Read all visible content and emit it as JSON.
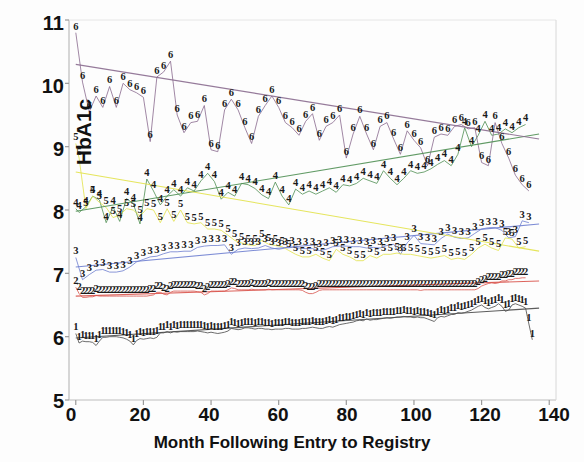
{
  "chart_data": {
    "type": "line",
    "title": "",
    "xlabel": "Month Following Entry to Registry",
    "ylabel": "HbA1c",
    "xlim": [
      -2,
      142
    ],
    "ylim": [
      5,
      11
    ],
    "xticks": [
      0,
      20,
      40,
      60,
      80,
      100,
      120,
      140
    ],
    "yticks": [
      5,
      6,
      7,
      8,
      9,
      10,
      11
    ],
    "grid": false,
    "legend": "none",
    "marker_style": "series index digit plotted at each data point",
    "series": [
      {
        "name": "1",
        "label": "1",
        "color": "#4a4a4a",
        "trend": {
          "x0": 0,
          "y0": 5.98,
          "x1": 137,
          "y1": 6.45
        },
        "x": [
          0,
          1,
          2,
          3,
          4,
          5,
          6,
          7,
          8,
          9,
          10,
          11,
          12,
          13,
          14,
          15,
          16,
          17,
          18,
          19,
          20,
          21,
          22,
          23,
          24,
          25,
          26,
          27,
          28,
          29,
          30,
          31,
          32,
          33,
          34,
          35,
          36,
          37,
          38,
          39,
          40,
          41,
          42,
          43,
          44,
          45,
          46,
          47,
          48,
          49,
          50,
          51,
          52,
          53,
          54,
          55,
          56,
          57,
          58,
          59,
          60,
          61,
          62,
          63,
          64,
          65,
          66,
          67,
          68,
          69,
          70,
          71,
          72,
          73,
          74,
          75,
          76,
          77,
          78,
          79,
          80,
          81,
          82,
          83,
          84,
          85,
          86,
          87,
          88,
          89,
          90,
          91,
          92,
          93,
          94,
          95,
          96,
          97,
          98,
          99,
          100,
          101,
          102,
          103,
          104,
          105,
          106,
          107,
          108,
          109,
          110,
          111,
          112,
          113,
          114,
          115,
          116,
          117,
          118,
          119,
          120,
          121,
          122,
          123,
          124,
          125,
          126,
          127,
          128,
          129,
          130,
          131,
          132,
          133,
          134,
          135
        ],
        "y": [
          6.05,
          5.9,
          5.93,
          5.92,
          5.92,
          5.91,
          5.86,
          5.93,
          5.99,
          5.99,
          6.0,
          6.0,
          6.0,
          5.99,
          5.98,
          5.96,
          5.93,
          5.87,
          5.94,
          5.97,
          5.96,
          5.97,
          5.98,
          5.97,
          5.99,
          6.06,
          6.06,
          6.08,
          6.06,
          6.08,
          6.07,
          6.08,
          6.08,
          6.08,
          6.08,
          6.08,
          6.09,
          6.08,
          6.07,
          6.06,
          6.07,
          6.06,
          6.05,
          6.06,
          6.07,
          6.09,
          6.13,
          6.12,
          6.11,
          6.12,
          6.14,
          6.14,
          6.13,
          6.12,
          6.13,
          6.13,
          6.12,
          6.12,
          6.11,
          6.12,
          6.12,
          6.12,
          6.13,
          6.13,
          6.12,
          6.12,
          6.12,
          6.13,
          6.13,
          6.14,
          6.15,
          6.14,
          6.13,
          6.13,
          6.15,
          6.16,
          6.15,
          6.17,
          6.19,
          6.2,
          6.21,
          6.22,
          6.23,
          6.25,
          6.26,
          6.25,
          6.28,
          6.26,
          6.27,
          6.27,
          6.28,
          6.29,
          6.3,
          6.29,
          6.3,
          6.31,
          6.31,
          6.32,
          6.31,
          6.31,
          6.3,
          6.31,
          6.3,
          6.3,
          6.28,
          6.26,
          6.24,
          6.3,
          6.32,
          6.31,
          6.33,
          6.35,
          6.35,
          6.38,
          6.37,
          6.38,
          6.4,
          6.42,
          6.45,
          6.48,
          6.5,
          6.46,
          6.44,
          6.46,
          6.48,
          6.52,
          6.48,
          6.4,
          6.42,
          6.5,
          6.52,
          6.5,
          6.48,
          6.45,
          6.2,
          5.95
        ]
      },
      {
        "name": "2",
        "label": "2",
        "color": "#d9544d",
        "trend": {
          "x0": 0,
          "y0": 6.64,
          "x1": 137,
          "y1": 6.88
        },
        "x": [
          0,
          1,
          2,
          3,
          4,
          5,
          6,
          7,
          8,
          9,
          10,
          11,
          12,
          13,
          14,
          15,
          16,
          17,
          18,
          19,
          20,
          21,
          22,
          23,
          24,
          25,
          26,
          27,
          28,
          29,
          30,
          31,
          32,
          33,
          34,
          35,
          36,
          37,
          38,
          39,
          40,
          41,
          42,
          43,
          44,
          45,
          46,
          47,
          48,
          49,
          50,
          51,
          52,
          53,
          54,
          55,
          56,
          57,
          58,
          59,
          60,
          61,
          62,
          63,
          64,
          65,
          66,
          67,
          68,
          69,
          70,
          71,
          72,
          73,
          74,
          75,
          76,
          77,
          78,
          79,
          80,
          81,
          82,
          83,
          84,
          85,
          86,
          87,
          88,
          89,
          90,
          91,
          92,
          93,
          94,
          95,
          96,
          97,
          98,
          99,
          100,
          101,
          102,
          103,
          104,
          105,
          106,
          107,
          108,
          109,
          110,
          111,
          112,
          113,
          114,
          115,
          116,
          117,
          118,
          119,
          120,
          121,
          122,
          123,
          124,
          125,
          126,
          127,
          128,
          129,
          130,
          131,
          132,
          133
        ],
        "y": [
          6.78,
          6.68,
          6.62,
          6.62,
          6.63,
          6.63,
          6.65,
          6.64,
          6.64,
          6.64,
          6.64,
          6.64,
          6.64,
          6.64,
          6.64,
          6.64,
          6.64,
          6.64,
          6.64,
          6.64,
          6.64,
          6.64,
          6.65,
          6.66,
          6.7,
          6.7,
          6.67,
          6.66,
          6.7,
          6.72,
          6.72,
          6.72,
          6.72,
          6.72,
          6.72,
          6.72,
          6.71,
          6.7,
          6.66,
          6.68,
          6.72,
          6.72,
          6.72,
          6.72,
          6.72,
          6.74,
          6.77,
          6.76,
          6.74,
          6.74,
          6.74,
          6.74,
          6.75,
          6.74,
          6.74,
          6.74,
          6.74,
          6.75,
          6.74,
          6.74,
          6.74,
          6.74,
          6.74,
          6.74,
          6.74,
          6.74,
          6.74,
          6.73,
          6.7,
          6.68,
          6.68,
          6.7,
          6.73,
          6.74,
          6.74,
          6.74,
          6.74,
          6.74,
          6.74,
          6.74,
          6.74,
          6.74,
          6.74,
          6.74,
          6.74,
          6.74,
          6.74,
          6.74,
          6.74,
          6.74,
          6.74,
          6.74,
          6.74,
          6.74,
          6.74,
          6.74,
          6.74,
          6.74,
          6.74,
          6.74,
          6.74,
          6.74,
          6.73,
          6.74,
          6.74,
          6.74,
          6.74,
          6.74,
          6.74,
          6.74,
          6.74,
          6.74,
          6.74,
          6.74,
          6.74,
          6.74,
          6.74,
          6.74,
          6.74,
          6.76,
          6.8,
          6.82,
          6.84,
          6.85,
          6.84,
          6.85,
          6.88,
          6.88,
          6.9,
          6.9,
          6.92,
          6.92,
          6.93,
          6.93
        ]
      },
      {
        "name": "3",
        "label": "3",
        "color": "#6f7fd0",
        "trend": {
          "x0": 0,
          "y0": 7.1,
          "x1": 137,
          "y1": 7.78
        },
        "x": [
          0,
          2,
          4,
          6,
          8,
          10,
          12,
          14,
          16,
          18,
          20,
          22,
          24,
          26,
          28,
          30,
          32,
          34,
          36,
          38,
          40,
          42,
          44,
          46,
          48,
          50,
          52,
          54,
          56,
          58,
          60,
          62,
          64,
          66,
          68,
          70,
          72,
          74,
          76,
          78,
          80,
          82,
          84,
          86,
          88,
          90,
          92,
          94,
          96,
          98,
          100,
          102,
          104,
          106,
          108,
          110,
          112,
          114,
          116,
          118,
          120,
          122,
          124,
          126,
          128,
          130,
          132,
          134
        ],
        "y": [
          7.25,
          6.9,
          6.98,
          7.05,
          7.06,
          7.02,
          7.02,
          7.04,
          7.1,
          7.18,
          7.22,
          7.26,
          7.27,
          7.31,
          7.34,
          7.34,
          7.35,
          7.35,
          7.41,
          7.43,
          7.44,
          7.44,
          7.45,
          7.3,
          7.38,
          7.4,
          7.39,
          7.4,
          7.44,
          7.4,
          7.38,
          7.4,
          7.41,
          7.4,
          7.39,
          7.39,
          7.36,
          7.38,
          7.42,
          7.43,
          7.43,
          7.42,
          7.42,
          7.4,
          7.41,
          7.4,
          7.44,
          7.46,
          7.3,
          7.48,
          7.6,
          7.47,
          7.46,
          7.45,
          7.55,
          7.62,
          7.57,
          7.55,
          7.56,
          7.63,
          7.7,
          7.72,
          7.72,
          7.68,
          7.56,
          7.58,
          7.83,
          7.8
        ]
      },
      {
        "name": "4",
        "label": "4",
        "color": "#4f8f53",
        "trend": {
          "x0": 0,
          "y0": 7.98,
          "x1": 137,
          "y1": 9.2
        },
        "x": [
          0,
          1,
          3,
          5,
          7,
          9,
          11,
          13,
          15,
          17,
          19,
          21,
          23,
          25,
          27,
          29,
          31,
          33,
          35,
          37,
          39,
          41,
          43,
          45,
          47,
          49,
          51,
          53,
          55,
          57,
          59,
          61,
          63,
          65,
          67,
          69,
          71,
          73,
          75,
          77,
          79,
          81,
          83,
          85,
          87,
          89,
          91,
          93,
          95,
          97,
          99,
          101,
          103,
          105,
          107,
          109,
          111,
          113,
          115,
          117,
          119,
          121,
          123,
          125,
          127,
          129,
          131,
          133
        ],
        "y": [
          8.02,
          7.96,
          8.05,
          8.22,
          8.16,
          7.8,
          8.05,
          7.82,
          8.18,
          8.1,
          7.78,
          8.49,
          8.3,
          8.08,
          8.22,
          8.32,
          8.22,
          8.35,
          8.3,
          8.46,
          8.58,
          8.45,
          8.17,
          8.28,
          8.22,
          8.42,
          8.4,
          8.34,
          8.24,
          8.18,
          8.44,
          8.22,
          8.08,
          8.33,
          8.25,
          8.3,
          8.25,
          8.3,
          8.35,
          8.28,
          8.4,
          8.38,
          8.42,
          8.5,
          8.46,
          8.42,
          8.62,
          8.5,
          8.4,
          8.5,
          8.62,
          8.58,
          8.6,
          8.65,
          8.72,
          8.78,
          8.7,
          8.88,
          9.3,
          9.0,
          9.18,
          9.4,
          9.18,
          9.2,
          9.28,
          9.22,
          9.3,
          9.35
        ]
      },
      {
        "name": "5",
        "label": "5",
        "color": "#e2e24a",
        "trend": {
          "x0": 0,
          "y0": 8.6,
          "x1": 137,
          "y1": 7.35
        },
        "x": [
          0,
          1,
          3,
          5,
          7,
          9,
          11,
          13,
          15,
          17,
          19,
          21,
          23,
          25,
          27,
          29,
          31,
          33,
          35,
          37,
          39,
          41,
          43,
          45,
          47,
          49,
          51,
          53,
          55,
          57,
          59,
          61,
          63,
          65,
          67,
          69,
          71,
          73,
          75,
          77,
          79,
          81,
          83,
          85,
          87,
          89,
          91,
          93,
          95,
          97,
          99,
          101,
          103,
          105,
          107,
          109,
          111,
          113,
          115,
          117,
          119,
          121,
          123,
          125,
          127,
          129,
          131,
          133
        ],
        "y": [
          9.05,
          8.82,
          8.02,
          8.22,
          8.12,
          8.04,
          7.88,
          7.92,
          8.02,
          8.0,
          7.9,
          8.02,
          8.0,
          7.8,
          8.02,
          7.82,
          8.0,
          7.8,
          7.78,
          7.8,
          7.7,
          7.7,
          7.68,
          7.6,
          7.52,
          7.48,
          7.45,
          7.44,
          7.52,
          7.46,
          7.44,
          7.42,
          7.36,
          7.3,
          7.26,
          7.26,
          7.3,
          7.24,
          7.2,
          7.38,
          7.3,
          7.26,
          7.2,
          7.2,
          7.28,
          7.24,
          7.3,
          7.3,
          7.32,
          7.3,
          7.3,
          7.28,
          7.26,
          7.24,
          7.26,
          7.28,
          7.22,
          7.24,
          7.22,
          7.3,
          7.4,
          7.46,
          7.4,
          7.36,
          7.56,
          7.54,
          7.4,
          7.42
        ]
      },
      {
        "name": "6",
        "label": "6",
        "color": "#8a6b8f",
        "trend": {
          "x0": 0,
          "y0": 10.3,
          "x1": 137,
          "y1": 9.12
        },
        "x": [
          0,
          2,
          4,
          6,
          8,
          10,
          12,
          14,
          16,
          18,
          20,
          22,
          24,
          26,
          28,
          30,
          32,
          34,
          36,
          38,
          40,
          42,
          44,
          46,
          48,
          50,
          52,
          54,
          56,
          58,
          60,
          62,
          64,
          66,
          68,
          70,
          72,
          74,
          76,
          78,
          80,
          82,
          84,
          86,
          88,
          90,
          92,
          94,
          96,
          98,
          100,
          102,
          104,
          106,
          108,
          110,
          112,
          114,
          116,
          118,
          120,
          122,
          124,
          126,
          128,
          130,
          132,
          134
        ],
        "y": [
          10.8,
          10.02,
          9.55,
          9.8,
          9.62,
          9.95,
          9.62,
          10.0,
          9.9,
          9.85,
          9.78,
          9.08,
          10.1,
          10.18,
          10.35,
          9.5,
          9.22,
          9.38,
          9.4,
          9.65,
          8.95,
          8.92,
          9.58,
          9.75,
          9.58,
          9.3,
          9.05,
          9.48,
          9.65,
          9.8,
          9.62,
          9.38,
          9.3,
          9.18,
          9.4,
          9.52,
          9.1,
          9.32,
          9.38,
          9.5,
          8.82,
          9.2,
          9.48,
          9.2,
          8.95,
          9.32,
          9.38,
          9.12,
          8.88,
          9.25,
          9.1,
          8.98,
          8.7,
          9.15,
          9.2,
          9.18,
          9.32,
          9.35,
          9.28,
          9.3,
          8.75,
          8.7,
          9.38,
          9.05,
          8.82,
          8.55,
          8.4,
          8.3
        ]
      }
    ]
  },
  "axis": {
    "y_title": "HbA1c",
    "x_title": "Month Following Entry to Registry",
    "y_tick_labels": [
      "11",
      "10",
      "9",
      "8",
      "7",
      "6",
      "5"
    ],
    "x_tick_labels": [
      "0",
      "20",
      "40",
      "60",
      "80",
      "100",
      "120",
      "140"
    ]
  }
}
